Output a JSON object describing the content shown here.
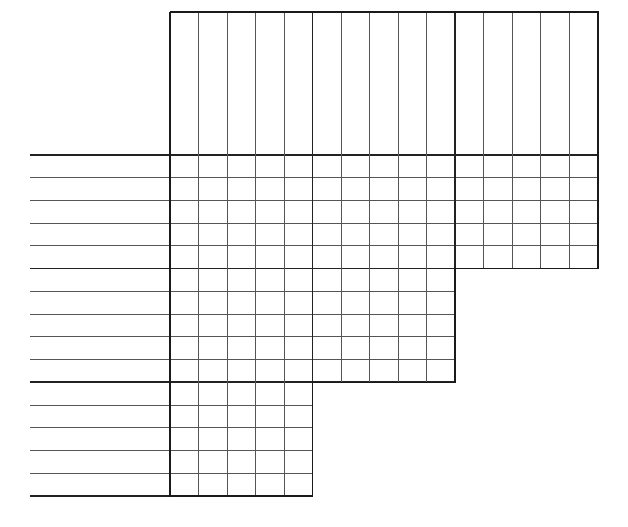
{
  "document": {
    "title": "Stepped Grid Form",
    "kind": "blank-ruled-grid-worksheet",
    "width": 628,
    "height": 527,
    "background_color": "#ffffff"
  },
  "style": {
    "line_color_normal": "#555555",
    "line_color_heavy": "#222222",
    "line_color_border": "#1a1a1a",
    "stroke_width_normal": 1,
    "stroke_width_heavy": 1.7,
    "stroke_width_border": 1.6
  },
  "geometry": {
    "label_gutter_left_x": 30,
    "grid_left_x": 170,
    "grid_right_x": 598,
    "grid_top_y": 12,
    "first_row_line_y": 155,
    "last_row_line_y": 496,
    "column_count": 15,
    "column_width": 28.53,
    "row_count": 15,
    "row_height": 22.73
  },
  "column_lines_x": [
    170,
    198.5,
    227,
    255.6,
    284.1,
    312.6,
    341.1,
    369.7,
    398.2,
    426.7,
    455.2,
    483.8,
    512.3,
    540.8,
    569.3,
    598
  ],
  "row_lines_y": [
    155,
    177.7,
    200.5,
    223.2,
    245.9,
    268.6,
    291.4,
    314.1,
    336.8,
    359.5,
    382.3,
    405,
    427.7,
    450.4,
    473.2,
    496
  ],
  "heavy_row_line_indices": [
    0,
    5,
    10,
    15
  ],
  "heavy_column_line_indices": [
    0,
    5,
    10,
    15
  ],
  "steps": [
    {
      "name": "upper-block",
      "left_x": 170,
      "right_x": 598,
      "top_y": 12,
      "bottom_y": 268.6,
      "columns": 15,
      "rows_below_header": 5
    },
    {
      "name": "middle-block",
      "left_x": 170,
      "right_x": 455.2,
      "top_y": 268.6,
      "bottom_y": 382.3,
      "columns": 10,
      "rows": 5
    },
    {
      "name": "lower-block",
      "left_x": 170,
      "right_x": 312.6,
      "top_y": 382.3,
      "bottom_y": 496,
      "columns": 5,
      "rows": 5
    }
  ],
  "label_rows": [
    {
      "index": 1,
      "label": "",
      "y": 155,
      "extends_to_x": 598
    },
    {
      "index": 2,
      "label": "",
      "y": 177.7,
      "extends_to_x": 598
    },
    {
      "index": 3,
      "label": "",
      "y": 200.5,
      "extends_to_x": 598
    },
    {
      "index": 4,
      "label": "",
      "y": 223.2,
      "extends_to_x": 598
    },
    {
      "index": 5,
      "label": "",
      "y": 245.9,
      "extends_to_x": 598
    },
    {
      "index": 6,
      "label": "",
      "y": 268.6,
      "extends_to_x": 598
    },
    {
      "index": 7,
      "label": "",
      "y": 291.4,
      "extends_to_x": 455.2
    },
    {
      "index": 8,
      "label": "",
      "y": 314.1,
      "extends_to_x": 455.2
    },
    {
      "index": 9,
      "label": "",
      "y": 336.8,
      "extends_to_x": 455.2
    },
    {
      "index": 10,
      "label": "",
      "y": 359.5,
      "extends_to_x": 455.2
    },
    {
      "index": 11,
      "label": "",
      "y": 382.3,
      "extends_to_x": 455.2
    },
    {
      "index": 12,
      "label": "",
      "y": 405,
      "extends_to_x": 312.6
    },
    {
      "index": 13,
      "label": "",
      "y": 427.7,
      "extends_to_x": 312.6
    },
    {
      "index": 14,
      "label": "",
      "y": 450.4,
      "extends_to_x": 312.6
    },
    {
      "index": 15,
      "label": "",
      "y": 473.2,
      "extends_to_x": 312.6
    },
    {
      "index": 16,
      "label": "",
      "y": 496,
      "extends_to_x": 312.6
    }
  ],
  "column_headers": [
    {
      "index": 1,
      "label": ""
    },
    {
      "index": 2,
      "label": ""
    },
    {
      "index": 3,
      "label": ""
    },
    {
      "index": 4,
      "label": ""
    },
    {
      "index": 5,
      "label": ""
    },
    {
      "index": 6,
      "label": ""
    },
    {
      "index": 7,
      "label": ""
    },
    {
      "index": 8,
      "label": ""
    },
    {
      "index": 9,
      "label": ""
    },
    {
      "index": 10,
      "label": ""
    },
    {
      "index": 11,
      "label": ""
    },
    {
      "index": 12,
      "label": ""
    },
    {
      "index": 13,
      "label": ""
    },
    {
      "index": 14,
      "label": ""
    },
    {
      "index": 15,
      "label": ""
    }
  ]
}
